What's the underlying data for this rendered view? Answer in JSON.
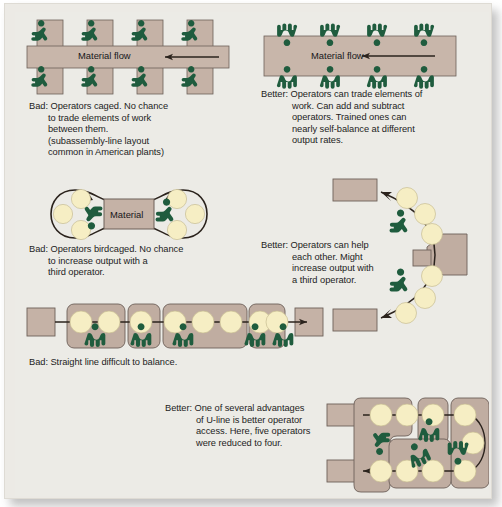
{
  "figure": {
    "background_color": "#ecebe6",
    "machine_color": "#c5b2a6",
    "operator_color": "#1f5c3e",
    "station_circle_color": "#f6eec4",
    "line_color": "#3a2f28"
  },
  "panels": [
    {
      "id": "caged-line",
      "kind": "bad",
      "flow_label": "Material flow",
      "caption_lines": [
        "Bad: Operators caged. No chance",
        "to trade elements of work",
        "between them.",
        "(subassembly-line layout",
        "common in American plants)"
      ],
      "machines_top": 4,
      "machines_bottom": 4,
      "operators_top": 4,
      "operators_bottom": 4
    },
    {
      "id": "shared-line",
      "kind": "better",
      "flow_label": "Material flow",
      "caption_lines": [
        "Better: Operators can trade elements of",
        "work. Can add and subtract",
        "operators. Trained ones can",
        "nearly self-balance at different",
        "output rates."
      ],
      "operators_top": 4,
      "operators_bottom": 4
    },
    {
      "id": "birdcage",
      "kind": "bad",
      "center_label": "Material",
      "caption_lines": [
        "Bad: Operators birdcaged. No chance",
        "to increase output with a",
        "third operator."
      ],
      "operators": 2,
      "stations_left": 3,
      "stations_right": 3
    },
    {
      "id": "u-arc",
      "kind": "better",
      "caption_lines": [
        "Better: Operators can help",
        "each other. Might",
        "increase output with",
        "a third operator."
      ],
      "operators": 2,
      "stations": 7
    },
    {
      "id": "straight-line",
      "kind": "bad",
      "caption_lines": [
        "Bad: Straight line difficult to balance."
      ],
      "operators": 5,
      "stations": 9
    },
    {
      "id": "u-line",
      "kind": "better",
      "caption_lines": [
        "Better: One of several advantages",
        "of U-line is better operator",
        "access. Here, five operators",
        "were reduced to four."
      ],
      "operators": 4,
      "stations": 8
    }
  ]
}
